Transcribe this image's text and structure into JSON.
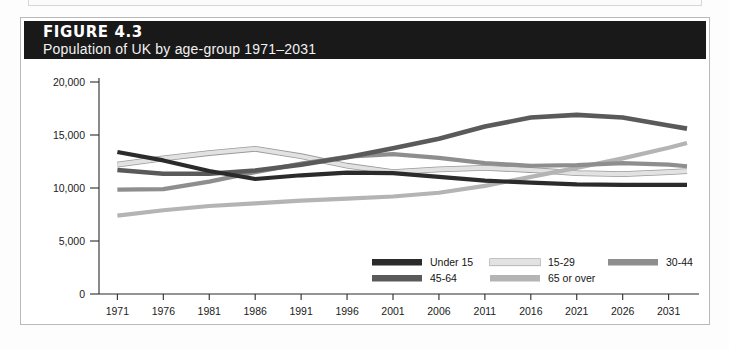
{
  "figure": {
    "number_label": "FIGURE 4.3",
    "subtitle": "Population of UK by age-group 1971–2031"
  },
  "colors": {
    "band_background": "#191919",
    "band_text": "#ffffff",
    "frame": "#b9b9b9",
    "axis": "#2a2a2a",
    "under15": "#2b2b2b",
    "age15_29": "#e2e2e2",
    "age30_44": "#8e8e8e",
    "age45_64": "#5a5a5a",
    "age65_over": "#b4b4b4"
  },
  "chart_data": {
    "type": "line",
    "title": "Population of UK by age-group 1971–2031",
    "xlabel": "",
    "ylabel": "",
    "ylim": [
      0,
      20000
    ],
    "yticks": [
      0,
      5000,
      10000,
      15000,
      20000
    ],
    "ytick_labels": [
      "0",
      "5,000",
      "10,000",
      "15,000",
      "20,000"
    ],
    "xlim": [
      1969,
      2033
    ],
    "x": [
      1971,
      1976,
      1981,
      1986,
      1991,
      1996,
      2001,
      2006,
      2011,
      2016,
      2021,
      2026,
      2031,
      2033
    ],
    "xticks": [
      1971,
      1976,
      1981,
      1986,
      1991,
      1996,
      2001,
      2006,
      2011,
      2016,
      2021,
      2026,
      2031
    ],
    "xtick_labels": [
      "1971",
      "1976",
      "1981",
      "1986",
      "1991",
      "1996",
      "2001",
      "2006",
      "2011",
      "2016",
      "2021",
      "2026",
      "2031"
    ],
    "grid": false,
    "legend_position": "inside-bottom-right",
    "series": [
      {
        "name": "Under 15",
        "color": "#2b2b2b",
        "width": 4.2,
        "outline": false,
        "values": [
          13400,
          12600,
          11600,
          10850,
          11200,
          11450,
          11400,
          11050,
          10700,
          10500,
          10350,
          10300,
          10300,
          10300
        ]
      },
      {
        "name": "15-29",
        "color": "#e2e2e2",
        "width": 4.2,
        "outline": true,
        "values": [
          12200,
          12800,
          13300,
          13700,
          13000,
          12100,
          11500,
          11750,
          11900,
          11700,
          11400,
          11300,
          11500,
          11600
        ]
      },
      {
        "name": "30-44",
        "color": "#8e8e8e",
        "width": 4.2,
        "outline": false,
        "values": [
          9850,
          9900,
          10600,
          11500,
          12300,
          12950,
          13200,
          12850,
          12350,
          12100,
          12150,
          12350,
          12200,
          12050
        ]
      },
      {
        "name": "45-64",
        "color": "#5a5a5a",
        "width": 4.6,
        "outline": false,
        "values": [
          11700,
          11350,
          11350,
          11650,
          12200,
          12900,
          13750,
          14650,
          15800,
          16650,
          16900,
          16650,
          15900,
          15600
        ]
      },
      {
        "name": "65 or over",
        "color": "#b4b4b4",
        "width": 4.2,
        "outline": false,
        "values": [
          7400,
          7900,
          8300,
          8550,
          8800,
          9000,
          9200,
          9550,
          10200,
          11050,
          11900,
          12800,
          13800,
          14250
        ]
      }
    ]
  },
  "legend": {
    "items": [
      {
        "label": "Under 15",
        "color": "#2b2b2b",
        "outline": false
      },
      {
        "label": "15-29",
        "color": "#e2e2e2",
        "outline": true
      },
      {
        "label": "30-44",
        "color": "#8e8e8e",
        "outline": false
      },
      {
        "label": "45-64",
        "color": "#5a5a5a",
        "outline": false
      },
      {
        "label": "65 or over",
        "color": "#b4b4b4",
        "outline": false
      }
    ]
  }
}
